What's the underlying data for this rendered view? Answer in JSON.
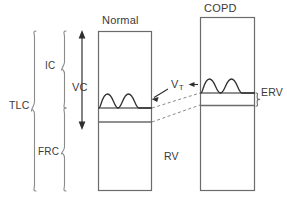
{
  "figure": {
    "background_color": "#ffffff",
    "line_color": "#595959",
    "text_color": "#3a3a3a",
    "dashed_color": "#8a8a8a"
  },
  "columns": [
    {
      "id": "normal",
      "header": "Normal",
      "box": {
        "x": 98,
        "y": 31,
        "width": 54,
        "height": 160
      },
      "tidal_baseline_y": 108,
      "frc_line_y": 122
    },
    {
      "id": "copd",
      "header": "COPD",
      "box": {
        "x": 200,
        "y": 17,
        "width": 55,
        "height": 174
      },
      "tidal_baseline_y": 93,
      "frc_line_y": 105
    }
  ],
  "labels": {
    "tlc": "TLC",
    "ic": "IC",
    "frc": "FRC",
    "vc": "VC",
    "rv": "RV",
    "erv": "ERV",
    "vt_main": "V",
    "vt_sub": "T"
  },
  "braces": [
    {
      "name": "tlc",
      "label": "TLC",
      "x": 34,
      "top": 31,
      "bottom": 191
    },
    {
      "name": "ic",
      "label": "IC",
      "x": 64,
      "top": 31,
      "bottom": 108
    },
    {
      "name": "frc",
      "label": "FRC",
      "x": 64,
      "top": 108,
      "bottom": 191
    },
    {
      "name": "erv",
      "label": "ERV",
      "x": 257,
      "top": 93,
      "bottom": 106
    }
  ],
  "arrows": {
    "vc": {
      "name": "vc-double-arrow",
      "x": 82,
      "top": 32,
      "bottom": 128,
      "double_headed": true
    },
    "vt_to_normal": {
      "name": "vt-arrow-normal",
      "from_x": 168,
      "from_y": 88,
      "to_x": 152,
      "to_y": 98
    },
    "vt_to_copd": {
      "name": "vt-arrow-copd",
      "from_x": 192,
      "from_y": 84,
      "to_x": 200,
      "to_y": 84
    }
  },
  "connectors": [
    {
      "name": "dashed-tidal-link",
      "x1": 152,
      "y1": 108,
      "x2": 200,
      "y2": 93
    },
    {
      "name": "dashed-frc-link",
      "x1": 152,
      "y1": 122,
      "x2": 200,
      "y2": 105
    }
  ],
  "waveforms": {
    "normal": {
      "name": "normal-tidal-wave",
      "baseline_y": 108,
      "peaks": 2,
      "amplitude": 14
    },
    "copd": {
      "name": "copd-tidal-wave",
      "baseline_y": 93,
      "peaks": 2,
      "amplitude": 14
    }
  }
}
